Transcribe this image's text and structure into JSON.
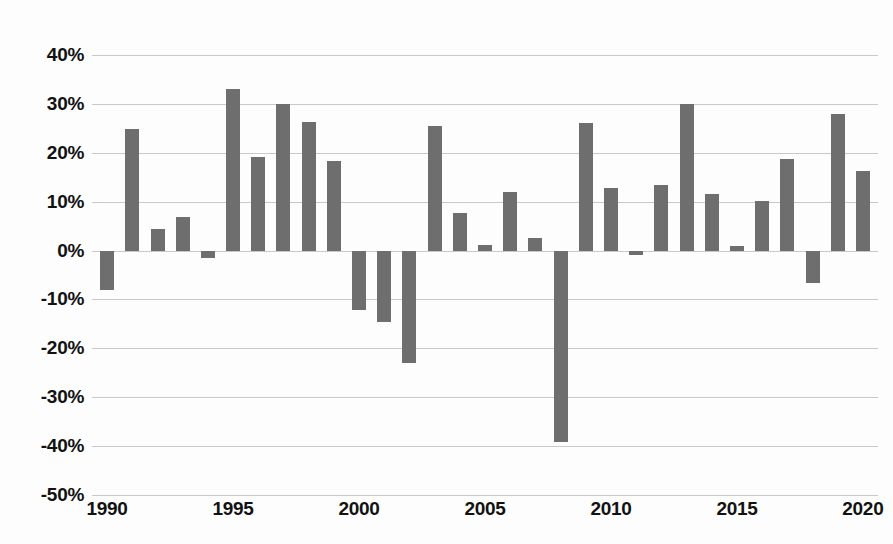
{
  "chart_data": {
    "type": "bar",
    "title": "",
    "subtitle": "",
    "xlabel": "",
    "ylabel": "",
    "xlim": [
      1989.4,
      2020.6
    ],
    "ylim": [
      -50,
      40
    ],
    "grid": true,
    "legend": false,
    "bar_color": "#6e6e6e",
    "grid_color": "#c9c9c9",
    "background_color": "#fdfdfd",
    "y_tick_labels": [
      "40%",
      "30%",
      "20%",
      "10%",
      "0%",
      "-10%",
      "-20%",
      "-30%",
      "-40%",
      "-50%"
    ],
    "y_ticks": [
      40,
      30,
      20,
      10,
      0,
      -10,
      -20,
      -30,
      -40,
      -50
    ],
    "x_tick_labels": [
      "1990",
      "1995",
      "2000",
      "2005",
      "2010",
      "2015",
      "2020"
    ],
    "x_ticks": [
      1990,
      1995,
      2000,
      2005,
      2010,
      2015,
      2020
    ],
    "categories": [
      "1990",
      "1991",
      "1992",
      "1993",
      "1994",
      "1995",
      "1996",
      "1997",
      "1998",
      "1999",
      "2000",
      "2001",
      "2002",
      "2003",
      "2004",
      "2005",
      "2006",
      "2007",
      "2008",
      "2009",
      "2010",
      "2011",
      "2012",
      "2013",
      "2014",
      "2015",
      "2016",
      "2017",
      "2018",
      "2019",
      "2020"
    ],
    "values": [
      -8.0,
      24.8,
      4.5,
      6.9,
      -1.5,
      33.1,
      19.1,
      29.9,
      26.2,
      18.3,
      -12.1,
      -14.6,
      -23.0,
      25.4,
      7.7,
      1.2,
      11.9,
      2.5,
      -39.2,
      26.0,
      12.8,
      -1.0,
      13.4,
      29.9,
      11.6,
      0.9,
      10.2,
      18.8,
      -6.7,
      27.9,
      16.2
    ],
    "units": "percent"
  }
}
